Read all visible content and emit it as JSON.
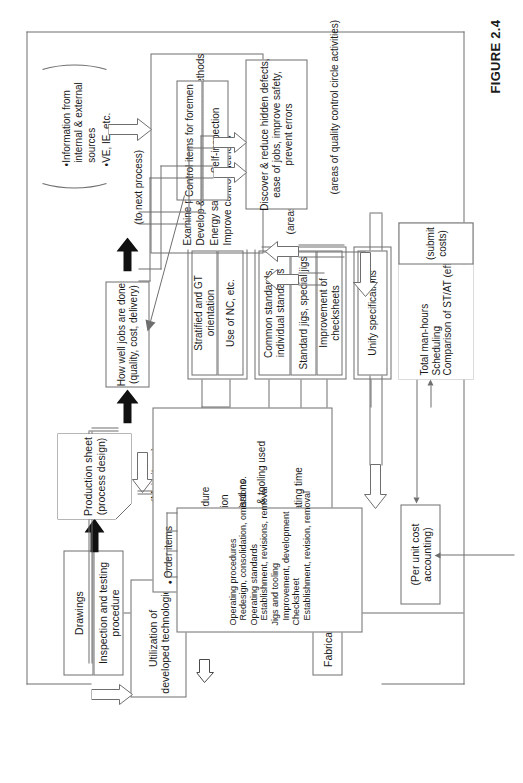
{
  "figure": {
    "number": "FIGURE 2.4",
    "frame_color": "#6e6e6e"
  },
  "nodes": {
    "drawings": "Drawings",
    "inspection_testing": "Inspection and testing procedure",
    "fabricating_department": "Fabricating department",
    "utilization": "Utilization of\ndeveloped technologies",
    "production_sheet": "Production sheet\n(process design)",
    "main_items_caption": "(Main items)",
    "per_unit_cost": "(Per unit cost\naccounting)",
    "total_man_hours": "Total man-hours\nScheduling\nComparison of ST/AT (efficiency)",
    "submit_costs": "(submit costs)",
    "stratified_gt": "Stratified and GT orientation",
    "use_of_nc": "Use of NC, etc.",
    "common_standards": "Common standards,\nindividual standards",
    "standard_jigs": "Standard jigs, special jigs",
    "improvement_checksheets": "Improvement of checksheets",
    "unify_specifications": "Unify specifications",
    "staff_activities": "Examine process capability\nDevelop & improve manufacturing methods\nEnergy savings, automation\nImprove control methods",
    "staff_activities_caption": "(areas of activities for staff personnel)",
    "information_sources": "Information from\ninternal & external\nsources",
    "ve_ie": "VE, IE, etc.",
    "how_well_jobs": "How well jobs are done\n(quality, cost, delivery)",
    "to_next_process": "(to next process)",
    "control_items": "Control items for foremen",
    "self_inspection": "Self-inspection",
    "qc_circle": "Discover & reduce hidden defects,\nease of jobs, improve safety,\nprevent errors",
    "qc_circle_caption": "(areas of quality control circle activities)",
    "operating_block": "Operating procedures\n  Redesign, consolidation, omissions\nOperating standards\n  Establishment, revisions, removal\nJigs and tooling\n  Improvement, development\nChecksheet\n  Establishment, revision, removal"
  },
  "main_items": [
    "Order items",
    "Machine class",
    "Operation procedure",
    "Scope of operation",
    "Operation standard no.",
    "Serial no. of jigs & tooling used",
    "Checkpoints",
    "Standard fabricating time",
    "Materials"
  ]
}
